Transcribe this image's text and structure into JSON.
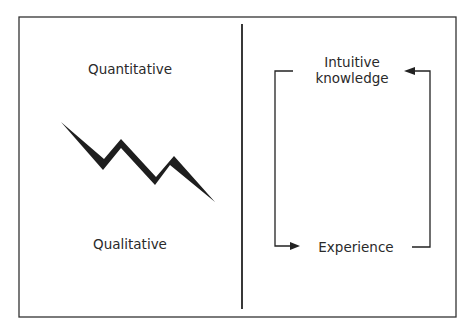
{
  "diagram": {
    "left_panel": {
      "top_label": "Quantitative",
      "bottom_label": "Qualitative",
      "graphic": "zigzag-descending-arrow"
    },
    "right_panel": {
      "top_label_line1": "Intuitive",
      "top_label_line2": "knowledge",
      "bottom_label": "Experience",
      "cycle": [
        {
          "from": "Intuitive knowledge",
          "to": "Experience",
          "path": "left-side-down"
        },
        {
          "from": "Experience",
          "to": "Intuitive knowledge",
          "path": "right-side-up"
        }
      ]
    },
    "colors": {
      "ink": "#222222",
      "background": "#ffffff"
    }
  }
}
